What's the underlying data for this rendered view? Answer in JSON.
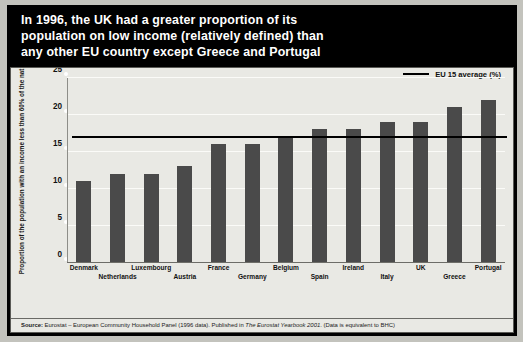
{
  "title": {
    "lines": [
      "In 1996, the UK had a greater proportion of its",
      "population on low income (relatively defined) than",
      "any other EU country except Greece and Portugal"
    ]
  },
  "legend": {
    "label": "EU 15 average (%)",
    "marker": "line-marker"
  },
  "source": {
    "prefix": "Source:",
    "text": "Eurostat – European Community Household Panel (1996 data). Published in ",
    "italic": "The Eurostat Yearbook 2001",
    "suffix": ". (Data is equivalent to BHC)"
  },
  "colors": {
    "background": "#000000",
    "panel": "#e9e9e4",
    "bar": "#4a4a4a",
    "average_line": "#000000",
    "title_text": "#ffffff",
    "gridline": "#fbfbf8"
  },
  "chart_data": {
    "type": "bar",
    "title": "In 1996, the UK had a greater proportion of its population on low income (relatively defined) than any other EU country except Greece and Portugal",
    "xlabel": "",
    "ylabel": "Proportion of the population with an income less than 60% of the national median (per cent)",
    "categories": [
      "Denmark",
      "Netherlands",
      "Luxembourg",
      "Austria",
      "France",
      "Germany",
      "Belgium",
      "Spain",
      "Ireland",
      "Italy",
      "UK",
      "Greece",
      "Portugal"
    ],
    "values": [
      11,
      12,
      12,
      13,
      16,
      16,
      17,
      18,
      18,
      19,
      19,
      21,
      22
    ],
    "ylim": [
      0,
      25
    ],
    "yticks": [
      0,
      5,
      10,
      15,
      20,
      25
    ],
    "ytick_labels": [
      "0",
      "5",
      "10",
      "15",
      "20",
      "25"
    ],
    "grid": true,
    "legend_position": "top-right",
    "annotations": [
      {
        "name": "eu-15-average",
        "type": "hline",
        "value": 17,
        "label": "EU 15 average (%)"
      }
    ]
  }
}
